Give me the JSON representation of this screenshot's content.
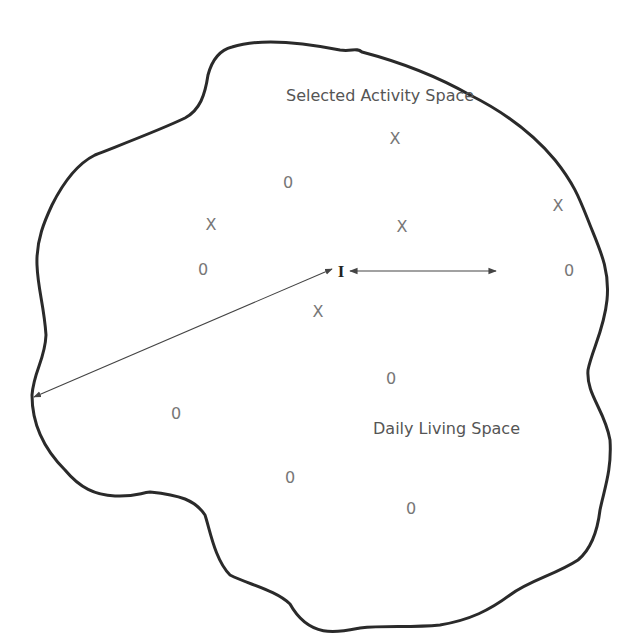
{
  "diagram": {
    "labels": {
      "selected_activity_space": "Selected Activity Space",
      "daily_living_space": "Daily Living Space",
      "individual": "I"
    },
    "x_marks": [
      {
        "text": "X",
        "x": 395,
        "y": 139
      },
      {
        "text": "X",
        "x": 211,
        "y": 225
      },
      {
        "text": "X",
        "x": 402,
        "y": 227
      },
      {
        "text": "X",
        "x": 558,
        "y": 206
      },
      {
        "text": "X",
        "x": 318,
        "y": 312
      }
    ],
    "o_marks": [
      {
        "text": "0",
        "x": 288,
        "y": 183
      },
      {
        "text": "0",
        "x": 203,
        "y": 270
      },
      {
        "text": "0",
        "x": 569,
        "y": 271
      },
      {
        "text": "0",
        "x": 391,
        "y": 379
      },
      {
        "text": "0",
        "x": 176,
        "y": 414
      },
      {
        "text": "0",
        "x": 290,
        "y": 478
      },
      {
        "text": "0",
        "x": 411,
        "y": 509
      }
    ],
    "colors": {
      "outline": "#2a2a2a",
      "arrow": "#444444",
      "mark_text": "#777777",
      "label_text": "#555555"
    }
  }
}
